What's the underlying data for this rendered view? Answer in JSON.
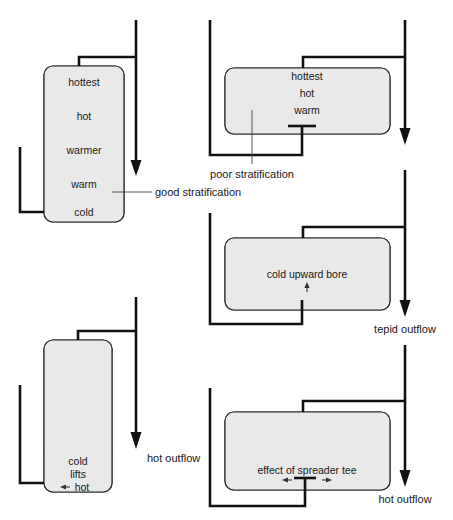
{
  "figure": {
    "background_color": "#ffffff",
    "tank_fill_color": "#e9e9e9",
    "line_color": "#111111"
  },
  "panels": [
    {
      "id": "panel-good-stratification",
      "orientation": "vertical",
      "bands": [
        {
          "label": "hottest",
          "hatch": "diagonal-right"
        },
        {
          "label": "hot",
          "hatch": "chevron"
        },
        {
          "label": "warmer",
          "hatch": "chevron"
        },
        {
          "label": "warm",
          "hatch": "chevron"
        },
        {
          "label": "cold",
          "hatch": "none"
        }
      ],
      "callout": "good stratification"
    },
    {
      "id": "panel-poor-stratification",
      "orientation": "horizontal",
      "bands": [
        {
          "label": "hottest",
          "hatch": "diagonal-right"
        },
        {
          "label": "hot",
          "hatch": "chevron"
        },
        {
          "label": "warm",
          "hatch": "chevron"
        },
        {
          "label": "",
          "hatch": "none"
        }
      ],
      "callout": "poor stratification",
      "fitting": "spreader-tee"
    },
    {
      "id": "panel-cold-upward-bore",
      "orientation": "horizontal",
      "bands": [
        {
          "label": "",
          "hatch": "diagonal-right"
        },
        {
          "label": "cold upward bore",
          "hatch": "none"
        }
      ],
      "callout": "cold upward bore",
      "outflow": "tepid outflow",
      "flow_arrow": "up"
    },
    {
      "id": "panel-cold-lifts-hot",
      "orientation": "vertical",
      "bands": [
        {
          "label": "",
          "hatch": "diagonal-right"
        },
        {
          "label": "cold lifts hot",
          "hatch": "none"
        }
      ],
      "lines": [
        "cold",
        "lifts",
        "hot"
      ],
      "outflow": "hot outflow",
      "flow_arrow": "left"
    },
    {
      "id": "panel-spreader-tee",
      "orientation": "horizontal",
      "bands": [
        {
          "label": "",
          "hatch": "diagonal-right"
        },
        {
          "label": "effect of spreader tee",
          "hatch": "none"
        }
      ],
      "callout": "effect of spreader tee",
      "outflow": "hot outflow",
      "fitting": "spreader-tee",
      "flow_arrows": [
        "left",
        "right"
      ]
    }
  ],
  "labels": {
    "hottest": "hottest",
    "hot": "hot",
    "warmer": "warmer",
    "warm": "warm",
    "cold": "cold",
    "good_stratification": "good stratification",
    "poor_stratification": "poor stratification",
    "cold_upward_bore": "cold upward bore",
    "tepid_outflow": "tepid outflow",
    "hot_outflow_left": "hot outflow",
    "hot_outflow_right": "hot outflow",
    "cold_word": "cold",
    "lifts_word": "lifts",
    "hot_word": "hot",
    "effect_of_spreader_tee": "effect of spreader tee"
  }
}
